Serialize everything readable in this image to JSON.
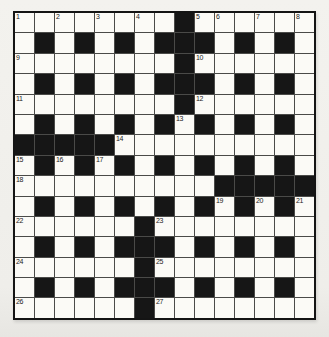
{
  "puzzle": {
    "kind": "crossword-grid",
    "rows": 15,
    "cols": 15,
    "grid": [
      "........#......",
      ".#.#.#.###.#.#.",
      "........#......",
      ".#.#.#.###.#.#.",
      "........#......",
      ".#.#.#.#.#.#.#.",
      "#####..........",
      ".#.#.#.#.#.#.#.",
      "..........#####",
      ".#.#.#.#.#.#.#.",
      "......#........",
      ".#.#.###.#.#.#.",
      "......#........",
      ".#.#.###.#.#.#.",
      "......#........"
    ],
    "numbers": [
      {
        "n": "1",
        "r": 0,
        "c": 0
      },
      {
        "n": "2",
        "r": 0,
        "c": 2
      },
      {
        "n": "3",
        "r": 0,
        "c": 4
      },
      {
        "n": "4",
        "r": 0,
        "c": 6
      },
      {
        "n": "5",
        "r": 0,
        "c": 9
      },
      {
        "n": "6",
        "r": 0,
        "c": 10
      },
      {
        "n": "7",
        "r": 0,
        "c": 12
      },
      {
        "n": "8",
        "r": 0,
        "c": 14
      },
      {
        "n": "9",
        "r": 2,
        "c": 0
      },
      {
        "n": "10",
        "r": 2,
        "c": 9
      },
      {
        "n": "11",
        "r": 4,
        "c": 0
      },
      {
        "n": "12",
        "r": 4,
        "c": 9
      },
      {
        "n": "13",
        "r": 5,
        "c": 8
      },
      {
        "n": "14",
        "r": 6,
        "c": 5
      },
      {
        "n": "15",
        "r": 7,
        "c": 0
      },
      {
        "n": "16",
        "r": 7,
        "c": 2
      },
      {
        "n": "17",
        "r": 7,
        "c": 4
      },
      {
        "n": "18",
        "r": 8,
        "c": 0
      },
      {
        "n": "19",
        "r": 9,
        "c": 10
      },
      {
        "n": "20",
        "r": 9,
        "c": 12
      },
      {
        "n": "21",
        "r": 9,
        "c": 14
      },
      {
        "n": "22",
        "r": 10,
        "c": 0
      },
      {
        "n": "23",
        "r": 10,
        "c": 7
      },
      {
        "n": "24",
        "r": 12,
        "c": 0
      },
      {
        "n": "25",
        "r": 12,
        "c": 7
      },
      {
        "n": "26",
        "r": 14,
        "c": 0
      },
      {
        "n": "27",
        "r": 14,
        "c": 7
      }
    ],
    "colors": {
      "page_bg": "#f1f0ec",
      "cell_white": "#fbfaf6",
      "cell_black": "#161616",
      "grid_line": "#4a4a48",
      "outer_border": "#141414",
      "number_text": "#1b1b1b"
    }
  }
}
